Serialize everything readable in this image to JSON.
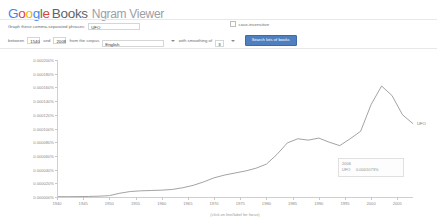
{
  "header": {
    "logo_google": [
      "G",
      "o",
      "o",
      "g",
      "l",
      "e"
    ],
    "logo_books": "Books",
    "logo_product": "Ngram Viewer"
  },
  "form": {
    "phrases_label": "Graph these comma-separated phrases:",
    "phrases_value": "UFO",
    "case_insensitive_label": "case-insensitive",
    "between_label": "between",
    "year_start": "1540",
    "and_label": "and",
    "year_end": "2008",
    "corpus_label": "from the corpus",
    "corpus_value": "English",
    "smoothing_label": "with smoothing of",
    "smoothing_value": "3",
    "search_button": "Search lots of books"
  },
  "tooltip": {
    "year": "2006",
    "series": "UFO",
    "value": "0.0001073%"
  },
  "chart_data": {
    "type": "line",
    "title": "",
    "xlabel": "",
    "ylabel": "",
    "caption": "(click on line/label for focus)",
    "series_label": "UFO",
    "legend_position": "right-inline",
    "grid": false,
    "xlim": [
      1940,
      2008
    ],
    "ylim": [
      0,
      0.0002
    ],
    "ytick_labels": [
      "0.000200%",
      "0.000180%",
      "0.000160%",
      "0.000140%",
      "0.000120%",
      "0.000100%",
      "0.000080%",
      "0.000060%",
      "0.000040%",
      "0.000020%",
      "0.000000%"
    ],
    "ytick_values": [
      0.0002,
      0.00018,
      0.00016,
      0.00014,
      0.00012,
      0.0001,
      8e-05,
      6e-05,
      4e-05,
      2e-05,
      0.0
    ],
    "xtick_labels": [
      "1940",
      "1945",
      "1950",
      "1955",
      "1960",
      "1965",
      "1970",
      "1975",
      "1980",
      "1985",
      "1990",
      "1995",
      "2000",
      "2005"
    ],
    "xtick_values": [
      1940,
      1945,
      1950,
      1955,
      1960,
      1965,
      1970,
      1975,
      1980,
      1985,
      1990,
      1995,
      2000,
      2005
    ],
    "series": [
      {
        "name": "UFO",
        "x": [
          1940,
          1942,
          1944,
          1946,
          1948,
          1950,
          1952,
          1954,
          1956,
          1958,
          1960,
          1962,
          1964,
          1966,
          1968,
          1970,
          1972,
          1974,
          1976,
          1978,
          1980,
          1982,
          1984,
          1986,
          1988,
          1990,
          1992,
          1994,
          1996,
          1998,
          2000,
          2002,
          2004,
          2006,
          2008
        ],
        "values": [
          5e-07,
          5e-07,
          6e-07,
          8e-07,
          1.2e-06,
          2e-06,
          5.5e-06,
          8e-06,
          9e-06,
          9.5e-06,
          1e-05,
          1.1e-05,
          1.35e-05,
          1.7e-05,
          2.2e-05,
          2.8e-05,
          3.2e-05,
          3.5e-05,
          3.8e-05,
          4.2e-05,
          4.8e-05,
          6.2e-05,
          7.9e-05,
          8.5e-05,
          8.3e-05,
          8.6e-05,
          8e-05,
          7.5e-05,
          8.5e-05,
          9.6e-05,
          0.000135,
          0.000162,
          0.000148,
          0.00012,
          0.000107
        ]
      }
    ]
  }
}
